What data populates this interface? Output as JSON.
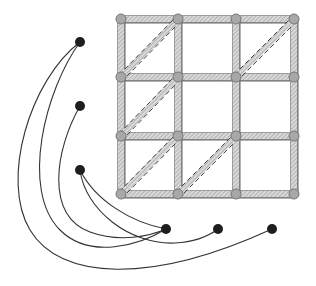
{
  "diagram": {
    "title": "",
    "grid": {
      "columns_x": [
        121,
        178,
        236,
        294
      ],
      "rows_y": [
        19,
        77,
        136,
        194
      ],
      "node_radius": 5,
      "node_fill": "#a8a8a8",
      "node_stroke": "#777777",
      "edge_band_color": "#bdbdbd",
      "edge_line_color": "#666666",
      "diagonal_cells": [
        {
          "row": 0,
          "col": 0
        },
        {
          "row": 0,
          "col": 2
        },
        {
          "row": 1,
          "col": 0
        },
        {
          "row": 2,
          "col": 0
        },
        {
          "row": 2,
          "col": 1
        }
      ]
    },
    "external_nodes": [
      {
        "id": "L1",
        "x": 80,
        "y": 42
      },
      {
        "id": "L2",
        "x": 80,
        "y": 106
      },
      {
        "id": "L3",
        "x": 80,
        "y": 170
      },
      {
        "id": "B1",
        "x": 166,
        "y": 229
      },
      {
        "id": "B2",
        "x": 218,
        "y": 229
      },
      {
        "id": "B3",
        "x": 272,
        "y": 229
      }
    ],
    "external_node_fill": "#1e1e1e",
    "external_node_radius": 5,
    "curves": [
      {
        "from": "L1",
        "to": "B3",
        "path": "M80,42 C30,80 0,180 30,230 C60,280 150,285 272,229"
      },
      {
        "from": "L1",
        "to": "B1",
        "path": "M80,42 C45,90 20,190 60,230 C90,260 140,245 166,229"
      },
      {
        "from": "L2",
        "to": "B1",
        "path": "M80,106 C55,150 45,215 90,232 C120,243 150,236 166,229"
      },
      {
        "from": "L3",
        "to": "B1",
        "path": "M80,170 C95,200 130,222 166,229"
      },
      {
        "from": "L3",
        "to": "B2",
        "path": "M80,170 C85,210 130,245 175,243 C195,242 210,235 218,229"
      }
    ],
    "curve_color": "#333333"
  }
}
